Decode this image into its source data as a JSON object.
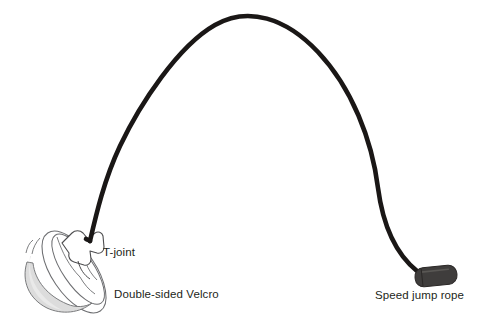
{
  "figure": {
    "background_color": "#ffffff",
    "labels": {
      "t_joint": "T-joint",
      "velcro": "Double-sided Velcro",
      "speed_rope": "Speed jump rope"
    },
    "colors": {
      "rope": "#1a1716",
      "handle": "#3f3d3c",
      "handle_outline": "#2a2726",
      "band_fill": "#f2f2f2",
      "band_shade": "#e0e0e0",
      "band_outline": "#58595b",
      "text": "#231f20"
    },
    "parts": [
      {
        "name": "speed-jump-rope",
        "description": "long black cord arcing from wrist strap to handle"
      },
      {
        "name": "t-joint",
        "description": "T shaped connector joining rope to wrist strap"
      },
      {
        "name": "double-sided-velcro",
        "description": "adjustable velcro wrist band loop"
      },
      {
        "name": "handle",
        "description": "dark gray cylindrical grip at the free end of the rope"
      }
    ]
  }
}
